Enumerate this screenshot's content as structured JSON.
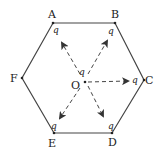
{
  "diagram": {
    "vertices": [
      {
        "id": "A",
        "label": "A",
        "x": 53,
        "y": 23,
        "charge": "q"
      },
      {
        "id": "B",
        "label": "B",
        "x": 115,
        "y": 23,
        "charge": "q"
      },
      {
        "id": "C",
        "label": "C",
        "x": 144,
        "y": 80,
        "charge": "q"
      },
      {
        "id": "D",
        "label": "D",
        "x": 112,
        "y": 133,
        "charge": "q"
      },
      {
        "id": "E",
        "label": "E",
        "x": 54,
        "y": 133,
        "charge": "q"
      },
      {
        "id": "F",
        "label": "F",
        "x": 22,
        "y": 78,
        "charge": ""
      }
    ],
    "center": {
      "label": "O",
      "x": 85,
      "y": 82,
      "charge": "q"
    },
    "arrows": [
      {
        "from": "O",
        "to": "A"
      },
      {
        "from": "O",
        "to": "B"
      },
      {
        "from": "O",
        "to": "C"
      },
      {
        "from": "O",
        "to": "D"
      },
      {
        "from": "O",
        "to": "E"
      }
    ],
    "labels": {
      "A": "A",
      "B": "B",
      "C": "C",
      "D": "D",
      "E": "E",
      "F": "F",
      "O": "O",
      "qA": "q",
      "qB": "q",
      "qC": "q",
      "qD": "q",
      "qE": "q",
      "qO": "q"
    },
    "colors": {
      "line": "#333333",
      "text": "#222222",
      "background": "#ffffff"
    }
  }
}
